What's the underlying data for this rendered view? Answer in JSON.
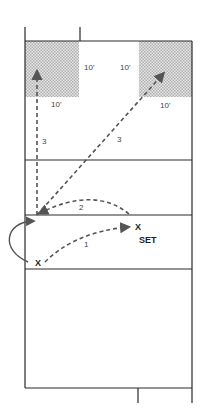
{
  "diagram": {
    "colors": {
      "line": "#2a2a2a",
      "shade": "#c8c8c8",
      "arrow": "#555555"
    },
    "zones": {
      "left_deep_corner": {
        "dim_right": "10'",
        "dim_bottom": "10'"
      },
      "right_deep_corner": {
        "dim_left": "10'",
        "dim_bottom": "10'"
      }
    },
    "labels": {
      "path_1": "1",
      "path_2": "2",
      "path_3_left": "3",
      "path_3_right": "3",
      "setter_mark": "X",
      "setter_label": "SET",
      "hitter_mark": "X"
    }
  }
}
